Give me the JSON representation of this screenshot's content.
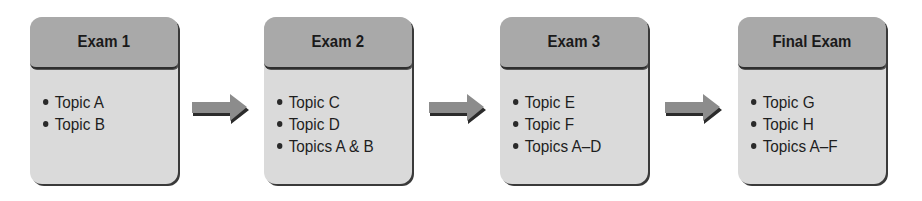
{
  "diagram": {
    "type": "flow",
    "direction": "left-to-right",
    "colors": {
      "header": "#a9a9a9",
      "body": "#dadada",
      "shadow": "#3a3a3a",
      "arrow": "#8c8c8c"
    },
    "stages": [
      {
        "title": "Exam 1",
        "topics": [
          "Topic A",
          "Topic B"
        ]
      },
      {
        "title": "Exam 2",
        "topics": [
          "Topic C",
          "Topic D",
          "Topics A & B"
        ]
      },
      {
        "title": "Exam 3",
        "topics": [
          "Topic E",
          "Topic F",
          "Topics A–D"
        ]
      },
      {
        "title": "Final Exam",
        "topics": [
          "Topic G",
          "Topic H",
          "Topics A–F"
        ]
      }
    ],
    "connectors": [
      {
        "from": "Exam 1",
        "to": "Exam 2",
        "icon": "right-arrow-icon"
      },
      {
        "from": "Exam 2",
        "to": "Exam 3",
        "icon": "right-arrow-icon"
      },
      {
        "from": "Exam 3",
        "to": "Final Exam",
        "icon": "right-arrow-icon"
      }
    ]
  }
}
